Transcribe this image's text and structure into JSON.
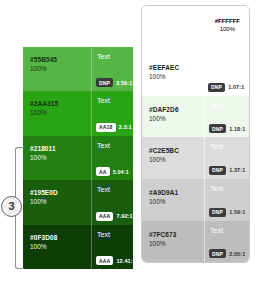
{
  "left_panel": {
    "name": "dark-green-contrast-scale",
    "swatches": [
      {
        "hex": "#55B545",
        "opacity": "100%",
        "bg": "#55B545",
        "label_color": "#16310f",
        "sample_text": "Text",
        "sample_text_color": "#ffffff",
        "badge": "DNP",
        "badge_bg": "#3b3b3b",
        "badge_color": "#ffffff",
        "ratio": "2.59:1",
        "ratio_color": "#ffffff"
      },
      {
        "hex": "#2AA315",
        "opacity": "100%",
        "bg": "#2AA315",
        "label_color": "#16310f",
        "sample_text": "Text",
        "sample_text_color": "#ffffff",
        "badge": "AA18",
        "badge_bg": "#ffffff",
        "badge_color": "#222222",
        "ratio": "3.3:1",
        "ratio_color": "#ffffff"
      },
      {
        "hex": "#218011",
        "opacity": "100%",
        "bg": "#218011",
        "label_color": "#ffffff",
        "sample_text": "Text",
        "sample_text_color": "#ffffff",
        "badge": "AA",
        "badge_bg": "#ffffff",
        "badge_color": "#222222",
        "ratio": "5.04:1",
        "ratio_color": "#ffffff"
      },
      {
        "hex": "#195E0D",
        "opacity": "100%",
        "bg": "#195E0D",
        "label_color": "#ffffff",
        "sample_text": "Text",
        "sample_text_color": "#ffffff",
        "badge": "AAA",
        "badge_bg": "#ffffff",
        "badge_color": "#222222",
        "ratio": "7.92:1",
        "ratio_color": "#ffffff"
      },
      {
        "hex": "#0F3D08",
        "opacity": "100%",
        "bg": "#0F3D08",
        "label_color": "#ffffff",
        "sample_text": "Text",
        "sample_text_color": "#ffffff",
        "badge": "AAA",
        "badge_bg": "#ffffff",
        "badge_color": "#222222",
        "ratio": "12.41:1",
        "ratio_color": "#ffffff"
      }
    ]
  },
  "right_panel": {
    "name": "light-green-contrast-scale",
    "top_label": {
      "hex": "#FFFFFF",
      "opacity": "100%",
      "text_color": "#555555"
    },
    "swatches": [
      {
        "hex": "#EEFAEC",
        "opacity": "100%",
        "bg": "#ffffff",
        "label_color": "#1d1d1d",
        "sample_text": "",
        "sample_text_color": "#ffffff",
        "badge": "DNP",
        "badge_bg": "#3b3b3b",
        "badge_color": "#ffffff",
        "ratio": "1.07:1",
        "ratio_color": "#333333"
      },
      {
        "hex": "#DAF2D6",
        "opacity": "100%",
        "bg": "#eef7ec",
        "label_color": "#1d1d1d",
        "sample_text": "Text",
        "sample_text_color": "#ffffff",
        "badge": "DNP",
        "badge_bg": "#3b3b3b",
        "badge_color": "#ffffff",
        "ratio": "1.18:1",
        "ratio_color": "#333333"
      },
      {
        "hex": "#C2E5BC",
        "opacity": "100%",
        "bg": "#dcdcdc",
        "label_color": "#1d1d1d",
        "sample_text": "Text",
        "sample_text_color": "#ffffff",
        "badge": "DNP",
        "badge_bg": "#3b3b3b",
        "badge_color": "#ffffff",
        "ratio": "1.37:1",
        "ratio_color": "#333333"
      },
      {
        "hex": "#A9D9A1",
        "opacity": "100%",
        "bg": "#cfcfcf",
        "label_color": "#1d1d1d",
        "sample_text": "Text",
        "sample_text_color": "#ffffff",
        "badge": "DNP",
        "badge_bg": "#3b3b3b",
        "badge_color": "#ffffff",
        "ratio": "1.59:1",
        "ratio_color": "#333333"
      },
      {
        "hex": "#7FC673",
        "opacity": "100%",
        "bg": "#bdbdbd",
        "label_color": "#1d1d1d",
        "sample_text": "Text",
        "sample_text_color": "#ffffff",
        "badge": "DNP",
        "badge_bg": "#3b3b3b",
        "badge_color": "#ffffff",
        "ratio": "2.05:1",
        "ratio_color": "#333333"
      }
    ]
  },
  "annotation": {
    "marker_number": "3"
  }
}
